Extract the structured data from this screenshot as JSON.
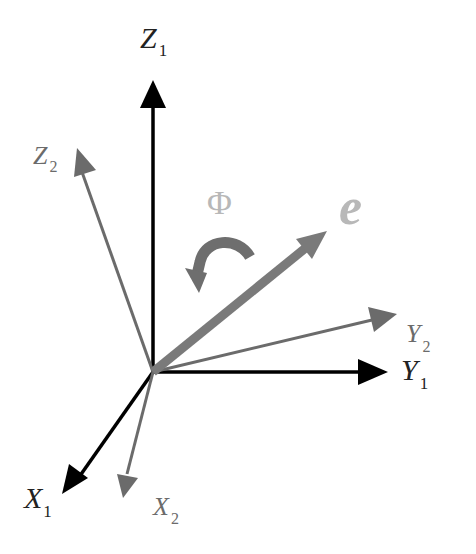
{
  "diagram": {
    "origin": [
      153,
      372
    ],
    "colors": {
      "frame1": "#000000",
      "frame2": "#6b6b6b",
      "axis_e": "#7a7a7a",
      "label_e": "#b8b8b8",
      "label_phi": "#b8b8b8",
      "rotation_arrow": "#6e6e6e"
    },
    "frame1": {
      "z": {
        "label": "Z",
        "sub": "1"
      },
      "y": {
        "label": "Y",
        "sub": "1"
      },
      "x": {
        "label": "X",
        "sub": "1"
      }
    },
    "frame2": {
      "z": {
        "label": "Z",
        "sub": "2"
      },
      "y": {
        "label": "Y",
        "sub": "2"
      },
      "x": {
        "label": "X",
        "sub": "2"
      }
    },
    "rotation_axis": {
      "label": "e"
    },
    "rotation_angle": {
      "label": "Φ"
    }
  }
}
